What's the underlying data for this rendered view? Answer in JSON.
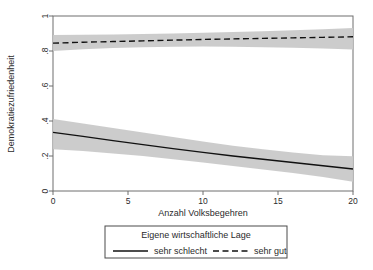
{
  "chart_data": {
    "type": "line",
    "title": "",
    "xlabel": "Anzahl Volksbegehren",
    "ylabel": "Demokratiezufriedenheit",
    "xlim": [
      0,
      20
    ],
    "ylim": [
      0,
      1
    ],
    "xticks": [
      0,
      5,
      10,
      15,
      20
    ],
    "xtick_labels": [
      "0",
      "5",
      "10",
      "15",
      "20"
    ],
    "yticks": [
      0,
      0.2,
      0.4,
      0.6,
      0.8,
      1
    ],
    "ytick_labels": [
      "0",
      ".2",
      ".4",
      ".6",
      ".8",
      "1"
    ],
    "grid": false,
    "legend_position": "below-plot",
    "legend_title": "Eigene wirtschaftliche Lage",
    "x": [
      0,
      2,
      4,
      6,
      8,
      10,
      12,
      14,
      16,
      18,
      20
    ],
    "series": [
      {
        "name": "sehr schlecht",
        "style": "solid",
        "color": "#111111",
        "values": [
          0.335,
          0.312,
          0.288,
          0.265,
          0.242,
          0.221,
          0.2,
          0.181,
          0.163,
          0.144,
          0.126
        ],
        "ci_lower": [
          0.238,
          0.228,
          0.215,
          0.2,
          0.182,
          0.163,
          0.143,
          0.123,
          0.103,
          0.08,
          0.053
        ],
        "ci_upper": [
          0.412,
          0.386,
          0.36,
          0.334,
          0.308,
          0.283,
          0.259,
          0.238,
          0.22,
          0.204,
          0.199
        ]
      },
      {
        "name": "sehr gut",
        "style": "dashed",
        "color": "#111111",
        "values": [
          0.845,
          0.85,
          0.854,
          0.858,
          0.862,
          0.866,
          0.869,
          0.872,
          0.875,
          0.878,
          0.881
        ],
        "ci_lower": [
          0.8,
          0.81,
          0.817,
          0.822,
          0.825,
          0.826,
          0.825,
          0.822,
          0.819,
          0.814,
          0.808
        ],
        "ci_upper": [
          0.892,
          0.893,
          0.895,
          0.897,
          0.9,
          0.904,
          0.908,
          0.913,
          0.919,
          0.925,
          0.932
        ]
      }
    ],
    "ci_band_color": "#c9c9c9"
  },
  "legend": {
    "title": "Eigene wirtschaftliche Lage",
    "entries": [
      {
        "label": "sehr schlecht",
        "style": "solid"
      },
      {
        "label": "sehr gut",
        "style": "dashed"
      }
    ]
  },
  "axes": {
    "x_title": "Anzahl Volksbegehren",
    "y_title": "Demokratiezufriedenheit"
  }
}
